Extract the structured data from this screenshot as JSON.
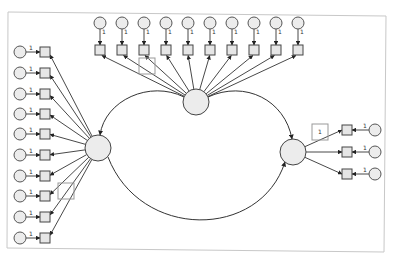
{
  "diagram": {
    "type": "structural-equation-model / confirmatory factor analysis path diagram",
    "fixed_loading_label": "1",
    "colors": {
      "frame": "#c8c8c8",
      "node_fill": "#e6e6e6",
      "stroke": "#333333",
      "highlight_box": "#999999"
    },
    "latent_factors": [
      {
        "id": "F_top",
        "cx": 196,
        "cy": 102,
        "r": 13,
        "indicator_count": 10
      },
      {
        "id": "F_left",
        "cx": 98,
        "cy": 148,
        "r": 13,
        "indicator_count": 10
      },
      {
        "id": "F_right",
        "cx": 293,
        "cy": 152,
        "r": 13,
        "indicator_count": 3
      }
    ],
    "top_indicators_x": [
      100,
      122,
      144,
      166,
      188,
      210,
      232,
      254,
      276,
      298
    ],
    "left_indicators_y": [
      52,
      73,
      94,
      114,
      134,
      155,
      176,
      196,
      217,
      238
    ],
    "right_indicators_y": [
      130,
      152,
      174
    ],
    "highlight_boxes": [
      {
        "x": 139,
        "y": 58,
        "w": 16,
        "h": 16,
        "label": ""
      },
      {
        "x": 58,
        "y": 183,
        "w": 16,
        "h": 16,
        "label": ""
      },
      {
        "x": 312,
        "y": 124,
        "w": 16,
        "h": 16,
        "label": "1"
      }
    ],
    "covariances": [
      {
        "from": "F_top",
        "to": "F_left"
      },
      {
        "from": "F_top",
        "to": "F_right"
      },
      {
        "from": "F_left",
        "to": "F_right"
      }
    ]
  }
}
